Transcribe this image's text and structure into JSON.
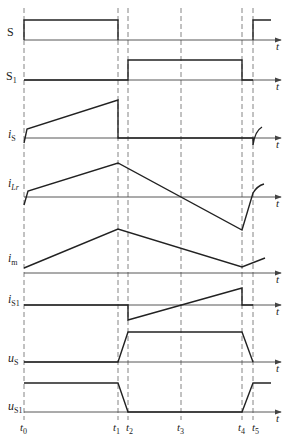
{
  "diagram": {
    "type": "timing-waveform",
    "time_markers": [
      {
        "id": "t0",
        "label": "t",
        "sub": "0",
        "x": 24
      },
      {
        "id": "t1",
        "label": "t",
        "sub": "1",
        "x": 118
      },
      {
        "id": "t2",
        "label": "t",
        "sub": "2",
        "x": 128
      },
      {
        "id": "t3",
        "label": "t",
        "sub": "3",
        "x": 181
      },
      {
        "id": "t4",
        "label": "t",
        "sub": "4",
        "x": 242
      },
      {
        "id": "t5",
        "label": "t",
        "sub": "5",
        "x": 253
      }
    ],
    "axis_arrow_label": "t",
    "signals": [
      {
        "id": "S",
        "label": "S",
        "sub": "",
        "axis_y": 40
      },
      {
        "id": "S1",
        "label": "S",
        "sub": "1",
        "axis_y": 80
      },
      {
        "id": "iS",
        "label": "i",
        "sub": "S",
        "axis_y": 138
      },
      {
        "id": "iLr",
        "label": "i",
        "sub": "Lr",
        "axis_y": 197
      },
      {
        "id": "im",
        "label": "i",
        "sub": "m",
        "axis_y": 273
      },
      {
        "id": "iS1",
        "label": "i",
        "sub": "S1",
        "axis_y": 305
      },
      {
        "id": "uS",
        "label": "u",
        "sub": "S",
        "axis_y": 362
      },
      {
        "id": "uS1",
        "label": "u",
        "sub": "S1",
        "axis_y": 412
      }
    ]
  }
}
